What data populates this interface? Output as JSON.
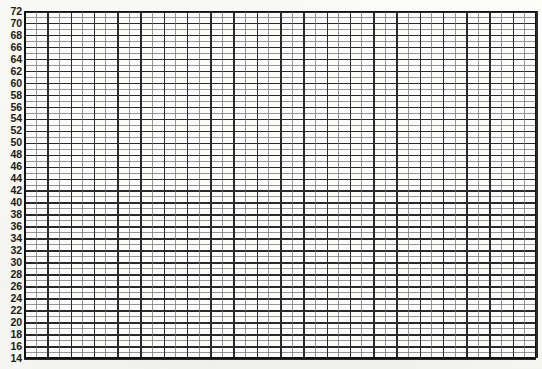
{
  "chart_data": {
    "type": "table",
    "title": "",
    "subtitle": "",
    "xlabel": "",
    "ylabel": "",
    "grid": true,
    "legend": null,
    "series": [],
    "x": [],
    "values": [],
    "ylim": [
      14,
      72
    ],
    "xlim": [
      0,
      44
    ],
    "y_tick_step": 2,
    "y_tick_labels": [
      "72",
      "70",
      "68",
      "66",
      "64",
      "62",
      "60",
      "58",
      "56",
      "54",
      "52",
      "50",
      "48",
      "46",
      "44",
      "42",
      "40",
      "38",
      "36",
      "34",
      "32",
      "30",
      "28",
      "26",
      "24",
      "22",
      "20",
      "18",
      "16",
      "14"
    ],
    "x_tick_labels": [],
    "grid_rows_major": 29,
    "grid_cols_major": 22,
    "grid_minor_subdivisions": 2
  },
  "axis": {
    "y_labels": [
      "72",
      "70",
      "68",
      "66",
      "64",
      "62",
      "60",
      "58",
      "56",
      "54",
      "52",
      "50",
      "48",
      "46",
      "44",
      "42",
      "40",
      "38",
      "36",
      "34",
      "32",
      "30",
      "28",
      "26",
      "24",
      "22",
      "20",
      "18",
      "16",
      "14"
    ]
  },
  "colors": {
    "paper": "#fdfdfb",
    "plot_background": "#fcfcfa",
    "grid_major": "#2a2a2a",
    "grid_minor": "#6f6f6f",
    "axis": "#111111",
    "label_text": "#1b1b1b"
  }
}
